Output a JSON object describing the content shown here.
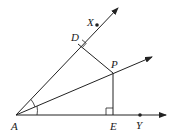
{
  "diagram": {
    "type": "angle-bisector-geometry",
    "colors": {
      "line": "#222222",
      "background": "#ffffff"
    },
    "points": {
      "A": {
        "label": "A",
        "x": 16,
        "y": 115
      },
      "D": {
        "label": "D",
        "x": 78,
        "y": 44
      },
      "X": {
        "label": "X",
        "x": 97,
        "y": 25
      },
      "P": {
        "label": "P",
        "x": 113,
        "y": 73
      },
      "E": {
        "label": "E",
        "x": 113,
        "y": 115
      },
      "Y": {
        "label": "Y",
        "x": 140,
        "y": 115
      }
    },
    "rays": [
      {
        "name": "ray-AX",
        "from": "A",
        "through": "X"
      },
      {
        "name": "ray-AP",
        "from": "A",
        "through": "P"
      },
      {
        "name": "ray-AY",
        "from": "A",
        "through": "Y"
      }
    ],
    "segments": [
      {
        "name": "segment-PD",
        "from": "P",
        "to": "D"
      },
      {
        "name": "segment-PE",
        "from": "P",
        "to": "E"
      }
    ],
    "right_angles": [
      "D",
      "E"
    ],
    "equal_angle_marks_at": "A"
  }
}
